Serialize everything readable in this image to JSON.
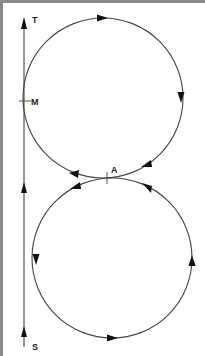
{
  "diagram": {
    "labels": {
      "top": "T",
      "middle": "M",
      "crossing": "A",
      "bottom": "S"
    },
    "colors": {
      "stroke": "#3a3a3a",
      "arrow": "#111111",
      "frame": "#8a8a8a",
      "background": "#ffffff"
    },
    "line": {
      "x": 24,
      "y_start": 347,
      "y_end": 20,
      "direction": "up"
    },
    "circles": [
      {
        "name": "upper",
        "cx": 103,
        "cy": 98,
        "r": 80,
        "direction": "clockwise"
      },
      {
        "name": "lower",
        "cx": 112,
        "cy": 258,
        "r": 80,
        "direction": "counterclockwise"
      }
    ]
  }
}
